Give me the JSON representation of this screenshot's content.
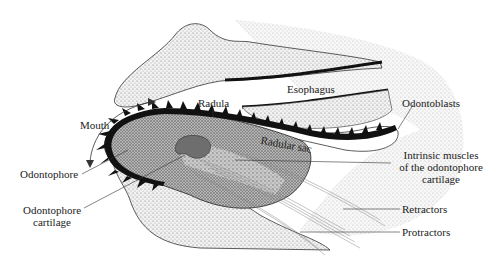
{
  "figure": {
    "labels": {
      "mouth": "Mouth",
      "radula": "Radula",
      "esophagus": "Esophagus",
      "odontoblasts": "Odontoblasts",
      "radular_sac": "Radular sac",
      "odontophore": "Odontophore",
      "odontophore_cartilage_l1": "Odontophore",
      "odontophore_cartilage_l2": "cartilage",
      "intrinsic_l1": "Intrinsic muscles",
      "intrinsic_l2": "of the odontophore",
      "intrinsic_l3": "cartilage",
      "retractors": "Retractors",
      "protractors": "Protractors"
    },
    "colors": {
      "stipple_light": "#d9d9d9",
      "stipple_dark": "#8a8a8a",
      "cartilage": "#6e6e6e",
      "radula_teeth": "#111111",
      "line": "#333333"
    }
  }
}
